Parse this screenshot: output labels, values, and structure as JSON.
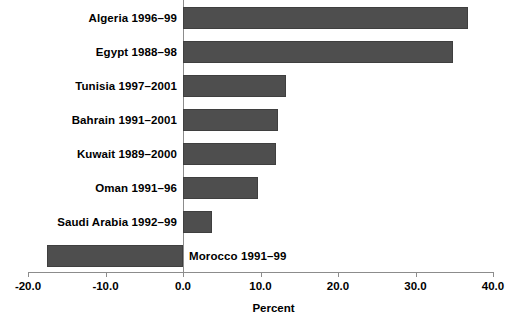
{
  "chart_data": {
    "type": "bar",
    "orientation": "horizontal",
    "title": "",
    "xlabel": "Percent",
    "ylabel": "",
    "xlim": [
      -20.0,
      40.0
    ],
    "xticks": [
      "-20.0",
      "-10.0",
      "0.0",
      "10.0",
      "20.0",
      "30.0",
      "40.0"
    ],
    "xtick_values": [
      -20.0,
      -10.0,
      0.0,
      10.0,
      20.0,
      30.0,
      40.0
    ],
    "grid": false,
    "legend": "none",
    "bar_color": "#4e4e4e",
    "axis_color": "#8c8c8c",
    "categories": [
      "Algeria 1996–99",
      "Egypt  1988–98",
      "Tunisia 1997–2001",
      "Bahrain 1991–2001",
      "Kuwait 1989–2000",
      "Oman 1991–96",
      "Saudi Arabia 1992–99",
      "Morocco  1991–99"
    ],
    "values": [
      36.8,
      34.8,
      13.3,
      12.3,
      12.0,
      9.7,
      3.8,
      -17.5
    ],
    "bars": [
      {
        "label": "Algeria 1996–99",
        "value": 36.8,
        "label_side": "left"
      },
      {
        "label": "Egypt  1988–98",
        "value": 34.8,
        "label_side": "left"
      },
      {
        "label": "Tunisia 1997–2001",
        "value": 13.3,
        "label_side": "left"
      },
      {
        "label": "Bahrain 1991–2001",
        "value": 12.3,
        "label_side": "left"
      },
      {
        "label": "Kuwait 1989–2000",
        "value": 12.0,
        "label_side": "left"
      },
      {
        "label": "Oman 1991–96",
        "value": 9.7,
        "label_side": "left"
      },
      {
        "label": "Saudi Arabia 1992–99",
        "value": 3.8,
        "label_side": "left"
      },
      {
        "label": "Morocco  1991–99",
        "value": -17.5,
        "label_side": "right"
      }
    ]
  }
}
